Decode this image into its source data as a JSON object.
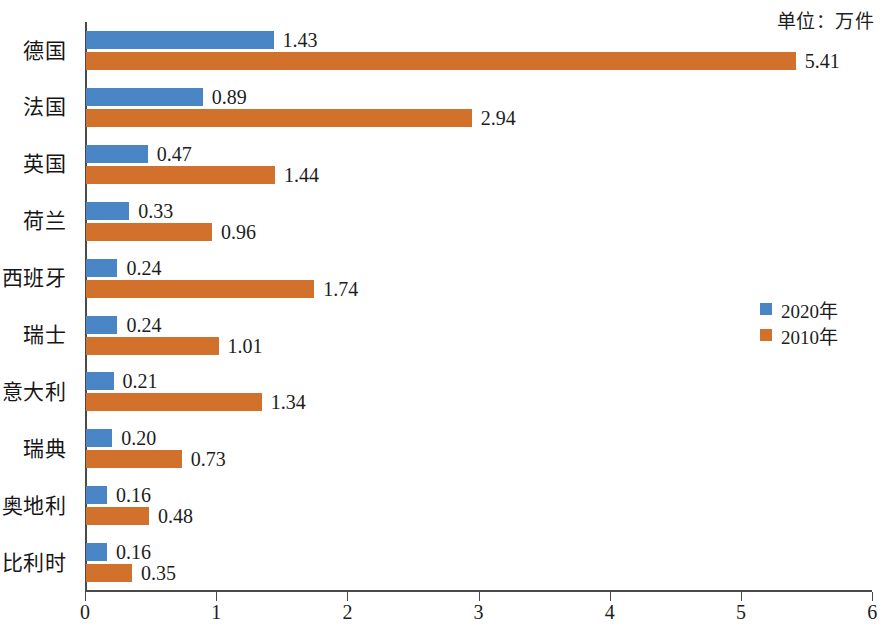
{
  "unit_note": "单位：万件",
  "legend": {
    "position": "right",
    "entries": [
      {
        "label": "2020年",
        "color": "#4a86c5",
        "name": "series-2020"
      },
      {
        "label": "2010年",
        "color": "#d2712b",
        "name": "series-2010"
      }
    ]
  },
  "axis": {
    "x_ticks": [
      "0",
      "1",
      "2",
      "3",
      "4",
      "5",
      "6"
    ]
  },
  "chart_data": {
    "type": "bar",
    "orientation": "horizontal",
    "title": "",
    "subtitle": "",
    "xlabel": "",
    "ylabel": "",
    "unit": "万件",
    "xlim": [
      0,
      6
    ],
    "xticks": [
      0,
      1,
      2,
      3,
      4,
      5,
      6
    ],
    "grid": false,
    "legend_position": "right",
    "categories": [
      "德国",
      "法国",
      "英国",
      "荷兰",
      "西班牙",
      "瑞士",
      "意大利",
      "瑞典",
      "奥地利",
      "比利时"
    ],
    "series": [
      {
        "name": "2020年",
        "color": "#4a86c5",
        "values": [
          1.43,
          0.89,
          0.47,
          0.33,
          0.24,
          0.24,
          0.21,
          0.2,
          0.16,
          0.16
        ],
        "labels": [
          "1.43",
          "0.89",
          "0.47",
          "0.33",
          "0.24",
          "0.24",
          "0.21",
          "0.20",
          "0.16",
          "0.16"
        ]
      },
      {
        "name": "2010年",
        "color": "#d2712b",
        "values": [
          5.41,
          2.94,
          1.44,
          0.96,
          1.74,
          1.01,
          1.34,
          0.73,
          0.48,
          0.35
        ],
        "labels": [
          "5.41",
          "2.94",
          "1.44",
          "0.96",
          "1.74",
          "1.01",
          "1.34",
          "0.73",
          "0.48",
          "0.35"
        ]
      }
    ]
  }
}
